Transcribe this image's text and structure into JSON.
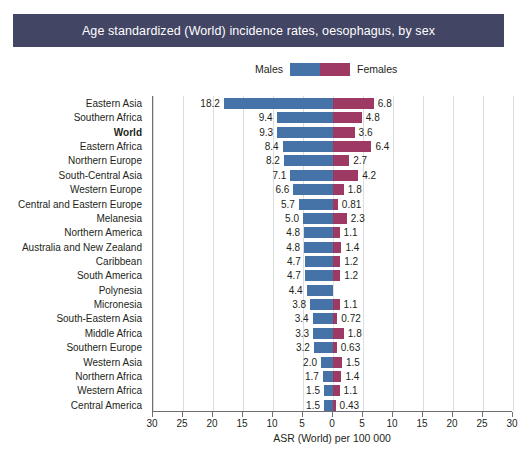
{
  "title": "Age standardized (World) incidence rates, oesophagus, by sex",
  "legend": {
    "male_label": "Males",
    "female_label": "Females",
    "male_color": "#4572a7",
    "female_color": "#9e3963",
    "position": "top-center"
  },
  "banner_color": "#424564",
  "chart_data": {
    "type": "bar",
    "orientation": "horizontal-diverging",
    "title": "Age standardized (World) incidence rates, oesophagus, by sex",
    "xlabel": "ASR (World) per 100 000",
    "ylabel": "",
    "xlim": [
      -30,
      30
    ],
    "xticks": [
      30,
      25,
      20,
      15,
      10,
      5.0,
      0,
      5.0,
      10,
      15,
      20,
      25,
      30
    ],
    "xtick_values": [
      -30,
      -25,
      -20,
      -15,
      -10,
      -5,
      0,
      5,
      10,
      15,
      20,
      25,
      30
    ],
    "grid": true,
    "categories": [
      "Eastern Asia",
      "Southern Africa",
      "World",
      "Eastern Africa",
      "Northern Europe",
      "South-Central Asia",
      "Western Europe",
      "Central and Eastern Europe",
      "Melanesia",
      "Northern America",
      "Australia and New Zealand",
      "Caribbean",
      "South America",
      "Polynesia",
      "Micronesia",
      "South-Eastern Asia",
      "Middle Africa",
      "Southern Europe",
      "Western Asia",
      "Northern Africa",
      "Western Africa",
      "Central America"
    ],
    "highlight_category": "World",
    "series": [
      {
        "name": "Males",
        "color": "#4572a7",
        "values": [
          18.2,
          9.4,
          9.3,
          8.4,
          8.2,
          7.1,
          6.6,
          5.7,
          5.0,
          4.8,
          4.8,
          4.7,
          4.7,
          4.4,
          3.8,
          3.4,
          3.3,
          3.2,
          2.0,
          1.7,
          1.5,
          1.5
        ],
        "labels": [
          "18.2",
          "9.4",
          "9.3",
          "8.4",
          "8.2",
          "7.1",
          "6.6",
          "5.7",
          "5.0",
          "4.8",
          "4.8",
          "4.7",
          "4.7",
          "4.4",
          "3.8",
          "3.4",
          "3.3",
          "3.2",
          "2.0",
          "1.7",
          "1.5",
          "1.5"
        ]
      },
      {
        "name": "Females",
        "color": "#9e3963",
        "values": [
          6.8,
          4.8,
          3.6,
          6.4,
          2.7,
          4.2,
          1.8,
          0.81,
          2.3,
          1.1,
          1.4,
          1.2,
          1.2,
          null,
          1.1,
          0.72,
          1.8,
          0.63,
          1.5,
          1.4,
          1.1,
          0.43
        ],
        "labels": [
          "6.8",
          "4.8",
          "3.6",
          "6.4",
          "2.7",
          "4.2",
          "1.8",
          "0.81",
          "2.3",
          "1.1",
          "1.4",
          "1.2",
          "1.2",
          "",
          "1.1",
          "0.72",
          "1.8",
          "0.63",
          "1.5",
          "1.4",
          "1.1",
          "0.43"
        ]
      }
    ]
  }
}
